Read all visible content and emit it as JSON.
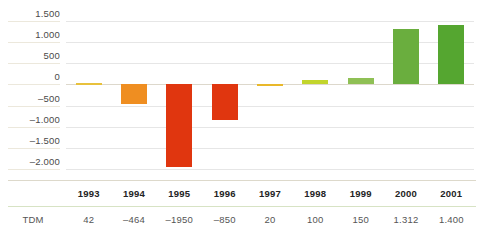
{
  "chart_data": {
    "type": "bar",
    "title": "",
    "subtitle": "",
    "xlabel": "",
    "ylabel": "",
    "categories": [
      "1993",
      "1994",
      "1995",
      "1996",
      "1997",
      "1998",
      "1999",
      "2000",
      "2001"
    ],
    "values": [
      42,
      -464,
      -1950,
      -850,
      20,
      100,
      150,
      1312,
      1400
    ],
    "value_labels": [
      "42",
      "–464",
      "–1950",
      "–850",
      "20",
      "100",
      "150",
      "1.312",
      "1.400"
    ],
    "bar_colors": [
      "#e8c13c",
      "#ef8e21",
      "#e0360f",
      "#e0360f",
      "#e9b82a",
      "#c2d52c",
      "#8fc055",
      "#6aae3e",
      "#55a630"
    ],
    "ylim": [
      -2250,
      1750
    ],
    "yticks": [
      1500,
      1000,
      500,
      0,
      -500,
      -1000,
      -1500,
      -2000
    ],
    "ytick_labels": [
      "1.500",
      "1.000",
      "500",
      "0",
      "–500",
      "–1.000",
      "–1.500",
      "–2.000"
    ],
    "grid": true,
    "legend": "none",
    "row_header": "TDM",
    "units": "TDM"
  },
  "table": {
    "row_label": "TDM",
    "header_row": [
      "1993",
      "1994",
      "1995",
      "1996",
      "1997",
      "1998",
      "1999",
      "2000",
      "2001"
    ],
    "value_row": [
      "42",
      "–464",
      "–1950",
      "–850",
      "20",
      "100",
      "150",
      "1.312",
      "1.400"
    ]
  },
  "colors": {
    "gridline": "#e6e6e6",
    "zero_line": "#ddd8cc",
    "rule_top": "#ddd9cb",
    "rule_mid": "#d7e3c4",
    "text": "#3c3c3c",
    "axis_text": "#4a4a4a"
  }
}
